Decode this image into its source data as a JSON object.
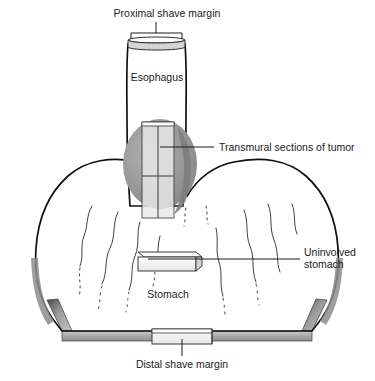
{
  "figure": {
    "type": "anatomical-diagram",
    "background_color": "#ffffff",
    "width": 375,
    "height": 381
  },
  "labels": {
    "proximal_shave_margin": "Proximal shave margin",
    "esophagus": "Esophagus",
    "transmural_sections": "Transmural sections of tumor",
    "uninvolved_stomach_line1": "Uninvolved",
    "uninvolved_stomach_line2": "stomach",
    "stomach": "Stomach",
    "distal_shave_margin": "Distal shave margin"
  },
  "colors": {
    "outline": "#111111",
    "text": "#1b1b1b",
    "tumor_dark": "#8a8a8a",
    "tumor_mid": "#a3a3a3",
    "tumor_light": "#cfcfcf",
    "section_block_face": "#f2f2f2",
    "section_block_top": "#fbfbfb",
    "section_block_side": "#d8d8d8",
    "wall_band": "#a8a8a8",
    "wall_band_light": "#c6c6c6",
    "organ_fill": "#ffffff"
  },
  "structures": [
    {
      "name": "esophagus-tube",
      "description": "vertical tubular esophagus"
    },
    {
      "name": "proximal-shave-margin-slab",
      "description": "thin transverse disc at top of esophagus"
    },
    {
      "name": "tumor-mass",
      "description": "grey ovoid tumor at gastroesophageal junction"
    },
    {
      "name": "transmural-section-block",
      "description": "rectangular block crossing tumor full thickness"
    },
    {
      "name": "stomach-body",
      "description": "opened stomach silhouette with rugal folds"
    },
    {
      "name": "uninvolved-stomach-block",
      "description": "rectangular sample block of uninvolved stomach"
    },
    {
      "name": "distal-shave-margin-block",
      "description": "rectangular block at distal resection edge"
    },
    {
      "name": "rugal-folds",
      "description": "wavy mucosal fold lines inside stomach"
    }
  ]
}
